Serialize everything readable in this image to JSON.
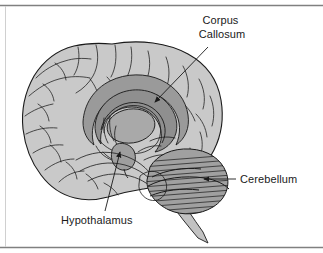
{
  "figure": {
    "type": "anatomical-diagram",
    "background_color": "#ffffff",
    "frame": {
      "top_rule_color": "#808080",
      "bottom_rule_color": "#808080",
      "left_rule_color": "#c4c4c4"
    },
    "colors": {
      "outline": "#1a1a1a",
      "cortex_fill": "#c9c9c9",
      "corpus_callosum_fill": "#9a9a9a",
      "thalamus_fill": "#a9a9a9",
      "cerebellum_fill": "#a0a0a0",
      "brainstem_fill": "#c2c2c2",
      "hypothalamus_fill": "#9e9e9e",
      "leader_line": "#1a1a1a",
      "label_text": "#1a1a1a"
    },
    "labels": [
      {
        "id": "corpus-callosum",
        "lines": [
          "Corpus",
          "Callosum"
        ],
        "text": "Corpus Callosum",
        "text_x": 222,
        "text_y": 24,
        "line_height": 14,
        "anchor": "middle",
        "leader": {
          "x1": 208,
          "y1": 47,
          "x2": 154,
          "y2": 103
        },
        "arrow": {
          "x": 152,
          "y": 105,
          "angle": 226
        }
      },
      {
        "id": "cerebellum",
        "lines": [
          "Cerebellum"
        ],
        "text": "Cerebellum",
        "text_x": 240,
        "text_y": 183,
        "line_height": 14,
        "anchor": "start",
        "leader": {
          "x1": 236,
          "y1": 179,
          "x2": 203,
          "y2": 179
        },
        "arrow": {
          "x": 200,
          "y": 179,
          "angle": 180
        }
      },
      {
        "id": "hypothalamus",
        "lines": [
          "Hypothalamus"
        ],
        "text": "Hypothalamus",
        "text_x": 61,
        "text_y": 224,
        "line_height": 14,
        "anchor": "start",
        "leader": {
          "x1": 105,
          "y1": 211,
          "x2": 120,
          "y2": 151
        },
        "arrow": {
          "x": 121,
          "y": 148,
          "angle": 283
        }
      }
    ],
    "structures": [
      {
        "id": "cerebral-cortex",
        "name": "cerebral cortex"
      },
      {
        "id": "corpus-callosum",
        "name": "corpus callosum"
      },
      {
        "id": "thalamus",
        "name": "thalamus"
      },
      {
        "id": "hypothalamus",
        "name": "hypothalamus"
      },
      {
        "id": "cerebellum",
        "name": "cerebellum"
      },
      {
        "id": "brainstem",
        "name": "brainstem"
      }
    ]
  }
}
